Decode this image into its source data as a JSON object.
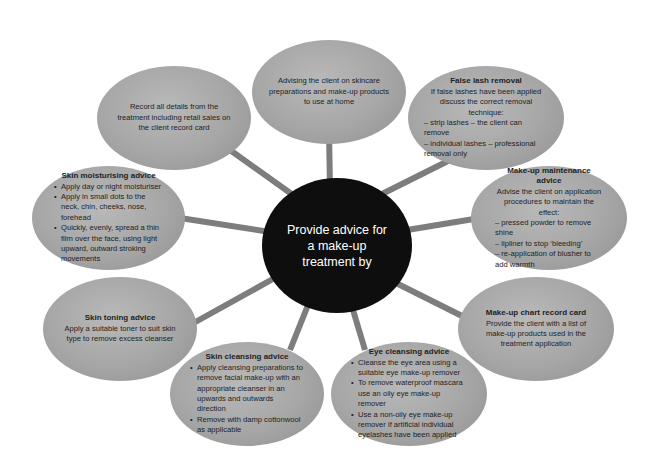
{
  "diagram": {
    "type": "spider-diagram",
    "colors": {
      "background": "#ffffff",
      "center_fill": "#0e0e0e",
      "center_text": "#ffffff",
      "node_fill": "#a6a6a6",
      "node_text": "#1e1e1e",
      "connector": "#7d7d7d"
    },
    "center": {
      "text": "Provide advice for a make-up treatment by"
    },
    "nodes": [
      {
        "id": "advising-skincare",
        "title": "",
        "body": "Advising the client on skincare preparations and make-up products to use at home"
      },
      {
        "id": "false-lash-removal",
        "title": "False lash removal",
        "body": "If false lashes have been applied discuss the correct removal technique:",
        "dashes": [
          "– strip lashes – the client can remove",
          "– individual lashes – professional removal only"
        ]
      },
      {
        "id": "make-up-maintenance",
        "title": "Make-up maintenance advice",
        "body": "Advise the client on application procedures to maintain the effect:",
        "dashes": [
          "– pressed powder to remove shine",
          "– lipliner to stop ‘bleeding’",
          "– re-application of blusher to add warmth"
        ]
      },
      {
        "id": "make-up-chart",
        "title": "Make-up chart record card",
        "body": "Provide the client with a list of make-up products used in the treatment application"
      },
      {
        "id": "eye-cleansing",
        "title": "Eye cleansing advice",
        "bullets": [
          "Cleanse the eye area using a suitable eye make-up remover",
          "To remove waterproof mascara use an oily eye make-up remover",
          "Use a non-oily eye make-up remover if artificial individual eyelashes have been applied"
        ]
      },
      {
        "id": "skin-cleansing",
        "title": "Skin cleansing advice",
        "bullets": [
          "Apply cleansing preparations to remove facial make-up with an appropriate cleanser in an upwards and outwards direction",
          "Remove with damp cottonwool as applicable"
        ]
      },
      {
        "id": "skin-toning",
        "title": "Skin toning advice",
        "body": "Apply a suitable toner to suit skin type to remove excess cleanser"
      },
      {
        "id": "skin-moisturising",
        "title": "Skin moisturising advice",
        "bullets": [
          "Apply day or night moisturiser",
          "Apply in small dots to the neck, chin, cheeks, nose, forehead",
          "Quickly, evenly, spread a thin film over the face, using light upward, outward stroking movements"
        ]
      },
      {
        "id": "record-details",
        "title": "",
        "body": "Record all details from the treatment including retail sales on the client record card"
      }
    ]
  }
}
